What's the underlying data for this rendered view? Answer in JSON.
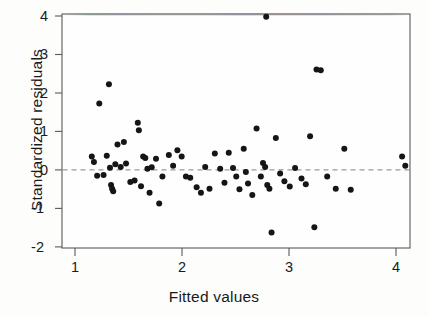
{
  "chart_data": {
    "type": "scatter",
    "title": "",
    "xlabel": "Fitted values",
    "ylabel": "Standardized residuals",
    "xlim": [
      0.92,
      4.18
    ],
    "ylim": [
      -2.15,
      4.05
    ],
    "xticks": [
      1,
      2,
      3,
      4
    ],
    "xtick_labels": [
      "1",
      "2",
      "3",
      "4"
    ],
    "yticks": [
      -2,
      -1,
      0,
      1,
      2,
      3,
      4
    ],
    "ytick_labels": [
      "-2",
      "-1",
      "0",
      "1",
      "2",
      "3",
      "4"
    ],
    "grid": false,
    "legend": null,
    "marker": "filled-circle",
    "marker_color": "#151515",
    "marker_size_px": 3.0,
    "reference_line": {
      "orientation": "horizontal",
      "y": 0,
      "style": "dashed",
      "color": "#8c8c8c"
    },
    "frame": {
      "style": "box",
      "color": "#5a5a5a",
      "top_edge_scan_artifact": true
    },
    "n_points": 75,
    "points": [
      [
        1.2,
        0.22
      ],
      [
        1.22,
        0.08
      ],
      [
        1.25,
        -0.28
      ],
      [
        1.27,
        1.6
      ],
      [
        1.31,
        -0.26
      ],
      [
        1.34,
        0.24
      ],
      [
        1.36,
        2.1
      ],
      [
        1.37,
        -0.07
      ],
      [
        1.38,
        -0.52
      ],
      [
        1.39,
        -0.62
      ],
      [
        1.4,
        -0.68
      ],
      [
        1.42,
        0.02
      ],
      [
        1.44,
        0.53
      ],
      [
        1.47,
        -0.05
      ],
      [
        1.5,
        0.6
      ],
      [
        1.52,
        0.04
      ],
      [
        1.56,
        -0.44
      ],
      [
        1.6,
        -0.4
      ],
      [
        1.63,
        1.1
      ],
      [
        1.64,
        0.9
      ],
      [
        1.66,
        -0.55
      ],
      [
        1.68,
        0.22
      ],
      [
        1.7,
        0.18
      ],
      [
        1.72,
        -0.1
      ],
      [
        1.74,
        -0.72
      ],
      [
        1.76,
        -0.06
      ],
      [
        1.8,
        0.16
      ],
      [
        1.83,
        -1.0
      ],
      [
        1.86,
        -0.3
      ],
      [
        1.92,
        0.26
      ],
      [
        1.96,
        -0.02
      ],
      [
        2.0,
        0.38
      ],
      [
        2.04,
        0.22
      ],
      [
        2.08,
        -0.3
      ],
      [
        2.12,
        -0.33
      ],
      [
        2.18,
        -0.58
      ],
      [
        2.22,
        -0.72
      ],
      [
        2.26,
        -0.05
      ],
      [
        2.3,
        -0.62
      ],
      [
        2.35,
        0.3
      ],
      [
        2.4,
        -0.1
      ],
      [
        2.44,
        -0.46
      ],
      [
        2.48,
        0.32
      ],
      [
        2.52,
        -0.08
      ],
      [
        2.55,
        -0.3
      ],
      [
        2.58,
        -0.63
      ],
      [
        2.62,
        0.42
      ],
      [
        2.64,
        -0.18
      ],
      [
        2.66,
        -0.48
      ],
      [
        2.7,
        -0.78
      ],
      [
        2.74,
        0.95
      ],
      [
        2.78,
        -0.3
      ],
      [
        2.8,
        0.05
      ],
      [
        2.82,
        -0.05
      ],
      [
        2.83,
        3.85
      ],
      [
        2.84,
        -0.52
      ],
      [
        2.86,
        -0.62
      ],
      [
        2.88,
        -1.75
      ],
      [
        2.92,
        0.7
      ],
      [
        2.96,
        -0.22
      ],
      [
        3.0,
        -0.42
      ],
      [
        3.05,
        -0.56
      ],
      [
        3.1,
        -0.08
      ],
      [
        3.16,
        -0.35
      ],
      [
        3.2,
        -0.5
      ],
      [
        3.24,
        0.75
      ],
      [
        3.28,
        -1.62
      ],
      [
        3.3,
        2.48
      ],
      [
        3.34,
        2.46
      ],
      [
        3.4,
        -0.3
      ],
      [
        3.48,
        -0.62
      ],
      [
        3.56,
        0.42
      ],
      [
        3.62,
        -0.64
      ],
      [
        4.1,
        0.22
      ],
      [
        4.13,
        -0.02
      ]
    ]
  },
  "plot_geometry": {
    "frame_left_px": 62,
    "frame_right_px": 410,
    "frame_top_px": 14,
    "frame_bottom_px": 248,
    "x_value_at_left_px": 0.9216,
    "x_px_per_unit": 107.0,
    "y_value_at_bottom_px": -2.1558,
    "y_px_per_unit": 38.5
  }
}
